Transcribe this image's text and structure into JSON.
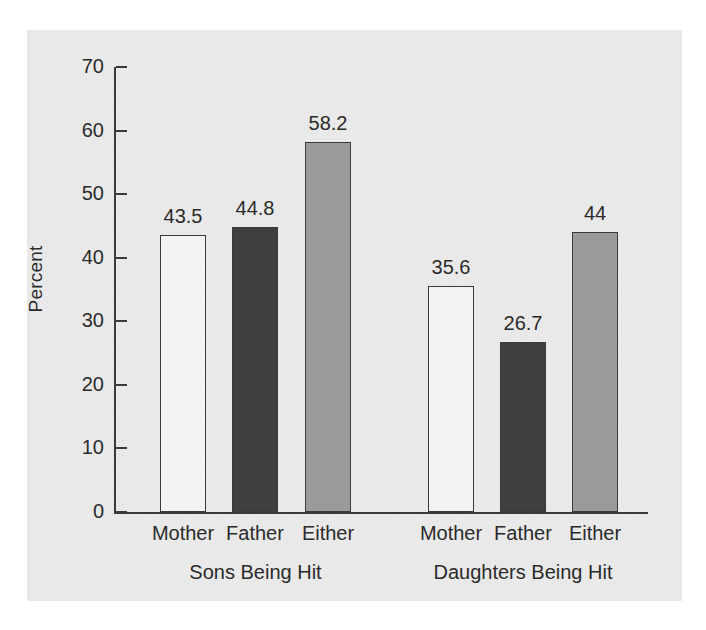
{
  "figure": {
    "panel_background": "#e9e9e9",
    "page_background": "#ffffff"
  },
  "chart_data": {
    "type": "bar",
    "title": "",
    "xlabel": "",
    "ylabel": "Percent",
    "ylim": [
      0,
      70
    ],
    "ytick_labels": [
      "70",
      "60",
      "50",
      "40",
      "30",
      "20",
      "10",
      "0"
    ],
    "yticks": [
      70,
      60,
      50,
      40,
      30,
      20,
      10,
      0
    ],
    "grid": false,
    "legend": "none",
    "groups": [
      {
        "label": "Sons Being Hit",
        "categories": [
          "Mother",
          "Father",
          "Either"
        ],
        "values": [
          43.5,
          44.8,
          58.2
        ],
        "value_labels": [
          "43.5",
          "44.8",
          "58.2"
        ],
        "colors": [
          "#f3f3f3",
          "#3f3f3f",
          "#9a9a9a"
        ]
      },
      {
        "label": "Daughters Being Hit",
        "categories": [
          "Mother",
          "Father",
          "Either"
        ],
        "values": [
          35.6,
          26.7,
          44.0
        ],
        "value_labels": [
          "35.6",
          "26.7",
          "44"
        ],
        "colors": [
          "#f3f3f3",
          "#3f3f3f",
          "#9a9a9a"
        ]
      }
    ],
    "series": [
      {
        "name": "Mother",
        "values": [
          43.5,
          35.6
        ],
        "color": "#f3f3f3"
      },
      {
        "name": "Father",
        "values": [
          44.8,
          26.7
        ],
        "color": "#3f3f3f"
      },
      {
        "name": "Either",
        "values": [
          58.2,
          44.0
        ],
        "color": "#9a9a9a"
      }
    ],
    "categories": [
      "Sons Being Hit",
      "Daughters Being Hit"
    ]
  },
  "layout": {
    "bars": [
      {
        "x": 160,
        "value_label_x": 160,
        "group": 0,
        "cat": 0
      },
      {
        "x": 232,
        "value_label_x": 232,
        "group": 0,
        "cat": 1
      },
      {
        "x": 305,
        "value_label_x": 305,
        "group": 0,
        "cat": 2
      },
      {
        "x": 428,
        "value_label_x": 428,
        "group": 1,
        "cat": 0
      },
      {
        "x": 500,
        "value_label_x": 500,
        "group": 1,
        "cat": 1
      },
      {
        "x": 572,
        "value_label_x": 572,
        "group": 1,
        "cat": 2
      }
    ],
    "bar_width": 46,
    "baseline_y": 512,
    "top_y": 67,
    "group_label_y": 562,
    "cat_label_y": 523
  }
}
